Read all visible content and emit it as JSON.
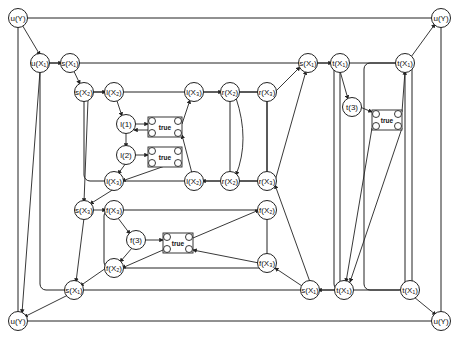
{
  "diagram": {
    "type": "hierarchical process graph",
    "colors": {
      "stroke": "#222222",
      "background": "#ffffff"
    },
    "nodes": [
      {
        "id": "uY_tl",
        "label": "u(Y)",
        "x": 18,
        "y": 18
      },
      {
        "id": "uX1",
        "label": "u(X₁)",
        "x": 40,
        "y": 63
      },
      {
        "id": "sX1_top",
        "label": "s(X₁)",
        "x": 70,
        "y": 63
      },
      {
        "id": "sX2",
        "label": "s(X₂)",
        "x": 84,
        "y": 92
      },
      {
        "id": "lX2_top",
        "label": "l(X₂)",
        "x": 114,
        "y": 92
      },
      {
        "id": "l1",
        "label": "l(1)",
        "x": 126,
        "y": 124
      },
      {
        "id": "l2",
        "label": "l(2)",
        "x": 126,
        "y": 155
      },
      {
        "id": "lX3_bot",
        "label": "l(X₃)",
        "x": 114,
        "y": 181
      },
      {
        "id": "lX3_top",
        "label": "l(X₃)",
        "x": 194,
        "y": 92
      },
      {
        "id": "lX2_bot",
        "label": "l(X₂)",
        "x": 194,
        "y": 181
      },
      {
        "id": "rX2_top",
        "label": "r(X₂)",
        "x": 230,
        "y": 92
      },
      {
        "id": "rX3_top",
        "label": "r(X₃)",
        "x": 267,
        "y": 92
      },
      {
        "id": "rX2_bot",
        "label": "r(X₂)",
        "x": 230,
        "y": 181
      },
      {
        "id": "rX3_bot",
        "label": "r(X₃)",
        "x": 267,
        "y": 181
      },
      {
        "id": "sX1_right",
        "label": "s(X₁)",
        "x": 308,
        "y": 63
      },
      {
        "id": "tX1_a",
        "label": "t(X₁)",
        "x": 340,
        "y": 63
      },
      {
        "id": "t3",
        "label": "t(3)",
        "x": 352,
        "y": 107
      },
      {
        "id": "tX1_b",
        "label": "t(X₁)",
        "x": 405,
        "y": 63
      },
      {
        "id": "uY_tr",
        "label": "u(Y)",
        "x": 441,
        "y": 18
      },
      {
        "id": "sX3",
        "label": "s(X₃)",
        "x": 84,
        "y": 210
      },
      {
        "id": "fX3_top",
        "label": "f(X₃)",
        "x": 114,
        "y": 210
      },
      {
        "id": "f3",
        "label": "f(3)",
        "x": 136,
        "y": 240
      },
      {
        "id": "fX2_bot",
        "label": "f(X₂)",
        "x": 114,
        "y": 268
      },
      {
        "id": "fX2_right",
        "label": "f(X₂)",
        "x": 267,
        "y": 210
      },
      {
        "id": "fX3_right",
        "label": "f(X₃)",
        "x": 267,
        "y": 263
      },
      {
        "id": "sX1_bl",
        "label": "s(X₁)",
        "x": 74,
        "y": 290
      },
      {
        "id": "sX1_br",
        "label": "s(X₁)",
        "x": 310,
        "y": 290
      },
      {
        "id": "tX1_c",
        "label": "t(X₁)",
        "x": 344,
        "y": 290
      },
      {
        "id": "tX1_d",
        "label": "t(X₁)",
        "x": 410,
        "y": 290
      },
      {
        "id": "uY_bl",
        "label": "u(Y)",
        "x": 18,
        "y": 321
      },
      {
        "id": "uY_br",
        "label": "u(Y)",
        "x": 441,
        "y": 321
      }
    ],
    "true_boxes": [
      {
        "label": "true",
        "x": 148,
        "y": 117,
        "w": 34,
        "h": 20
      },
      {
        "label": "true",
        "x": 148,
        "y": 147,
        "w": 34,
        "h": 20
      },
      {
        "label": "true",
        "x": 163,
        "y": 233,
        "w": 30,
        "h": 20
      },
      {
        "label": "true",
        "x": 372,
        "y": 110,
        "w": 30,
        "h": 20
      }
    ]
  }
}
